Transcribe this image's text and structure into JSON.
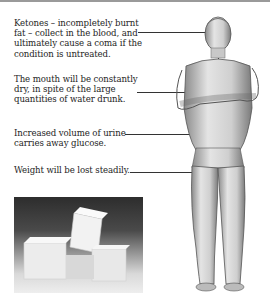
{
  "annotations": [
    {
      "id": "ketones",
      "text": "Ketones – incompletely burnt fat – collect in the blood, and ultimately cause a coma if the condition is untreated.",
      "target": "head"
    },
    {
      "id": "mouth",
      "text": "The mouth will be constantly dry, in spite of the large quantities of water drunk.",
      "target": "mouth"
    },
    {
      "id": "urine",
      "text": "Increased volume of urine carries away glucose.",
      "target": "groin"
    },
    {
      "id": "weight",
      "text": "Weight will be lost steadily.",
      "target": "thigh"
    }
  ],
  "lines": {
    "ketones_1": "Ketones – incompletely burnt",
    "ketones_2": "fat – collect in the blood, and",
    "ketones_3": "ultimately cause a coma if the",
    "ketones_4": "condition is untreated.",
    "mouth_1": "The mouth will be constantly",
    "mouth_2": "dry, in spite of the large",
    "mouth_3": "quantities of water drunk.",
    "urine_1": "Increased volume of urine",
    "urine_2": "carries away glucose.",
    "weight_1": "Weight will be lost steadily."
  },
  "illustrations": {
    "figure": "standing-man-arms-folded",
    "photo": "sugar-cubes"
  }
}
